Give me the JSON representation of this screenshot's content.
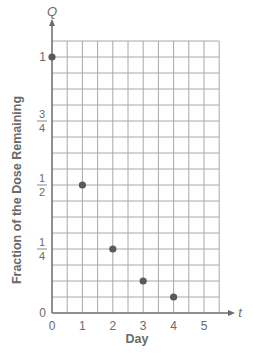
{
  "chart_data": {
    "type": "scatter",
    "title": "",
    "xlabel": "Day",
    "ylabel": "Fraction of the Dose Remaining",
    "x_axis_symbol": "t",
    "y_axis_symbol": "Q",
    "x": [
      0,
      1,
      2,
      3,
      4
    ],
    "values": [
      1,
      0.5,
      0.25,
      0.125,
      0.0625
    ],
    "series": [
      {
        "name": "Fraction remaining",
        "x": [
          0,
          1,
          2,
          3,
          4
        ],
        "values": [
          1,
          0.5,
          0.25,
          0.125,
          0.0625
        ]
      }
    ],
    "x_ticks": [
      "0",
      "1",
      "2",
      "3",
      "4",
      "5"
    ],
    "y_ticks": [
      {
        "value": 0,
        "label": "0"
      },
      {
        "value": 0.25,
        "label": "1/4"
      },
      {
        "value": 0.5,
        "label": "1/2"
      },
      {
        "value": 0.75,
        "label": "3/4"
      },
      {
        "value": 1,
        "label": "1"
      }
    ],
    "xlim": [
      0,
      5.5
    ],
    "ylim": [
      0,
      1.0625
    ],
    "grid": true,
    "grid_x_step": 0.5,
    "grid_y_step": 0.0625,
    "legend": null
  },
  "colors": {
    "grid": "#a8a8a8",
    "axis": "#6a6a6a",
    "point": "#5a5a5a",
    "text": "#6a6a6a"
  }
}
